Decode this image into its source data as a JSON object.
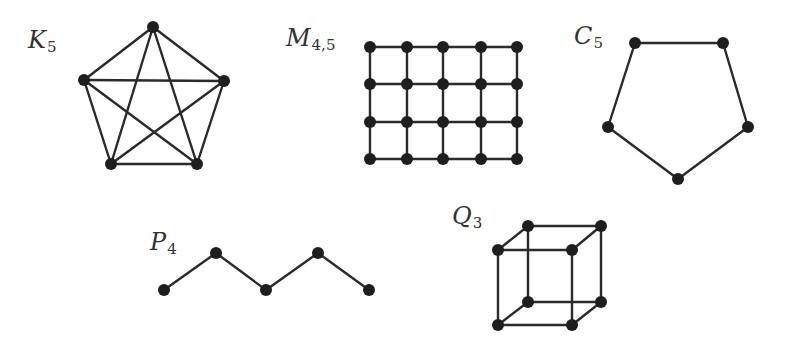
{
  "colors": {
    "edge": "#2a2a2a",
    "node": "#1e1e1e",
    "background": "#ffffff"
  },
  "style": {
    "node_radius": 6,
    "edge_width": 2.4
  },
  "graphs": [
    {
      "id": "K5",
      "label_main": "K",
      "label_sub": "5",
      "label_pos": [
        28,
        28
      ],
      "nodes": [
        [
          153,
          27
        ],
        [
          84,
          80
        ],
        [
          224,
          81
        ],
        [
          111,
          164
        ],
        [
          197,
          164
        ]
      ],
      "edges": [
        [
          0,
          1
        ],
        [
          0,
          2
        ],
        [
          0,
          3
        ],
        [
          0,
          4
        ],
        [
          1,
          2
        ],
        [
          1,
          3
        ],
        [
          1,
          4
        ],
        [
          2,
          3
        ],
        [
          2,
          4
        ],
        [
          3,
          4
        ]
      ]
    },
    {
      "id": "M45",
      "label_main": "M",
      "label_sub": "4,5",
      "label_pos": [
        286,
        26
      ],
      "grid": {
        "xs": [
          370,
          407,
          443,
          481,
          517
        ],
        "ys": [
          47,
          84,
          122,
          159
        ]
      }
    },
    {
      "id": "C5",
      "label_main": "C",
      "label_sub": "5",
      "label_pos": [
        574,
        24
      ],
      "nodes": [
        [
          635,
          43
        ],
        [
          723,
          43
        ],
        [
          748,
          127
        ],
        [
          678,
          179
        ],
        [
          608,
          127
        ]
      ],
      "edges": [
        [
          0,
          1
        ],
        [
          1,
          2
        ],
        [
          2,
          3
        ],
        [
          3,
          4
        ],
        [
          4,
          0
        ]
      ]
    },
    {
      "id": "P4",
      "label_main": "P",
      "label_sub": "4",
      "label_pos": [
        150,
        230
      ],
      "nodes": [
        [
          164,
          290
        ],
        [
          216,
          253
        ],
        [
          266,
          290
        ],
        [
          318,
          253
        ],
        [
          369,
          290
        ]
      ],
      "edges": [
        [
          0,
          1
        ],
        [
          1,
          2
        ],
        [
          2,
          3
        ],
        [
          3,
          4
        ]
      ]
    },
    {
      "id": "Q3",
      "label_main": "Q",
      "label_sub": "3",
      "label_pos": [
        452,
        204
      ],
      "nodes": [
        [
          528,
          226
        ],
        [
          601,
          226
        ],
        [
          528,
          302
        ],
        [
          601,
          302
        ],
        [
          498,
          250
        ],
        [
          572,
          250
        ],
        [
          498,
          325
        ],
        [
          572,
          325
        ]
      ],
      "edges": [
        [
          0,
          1
        ],
        [
          0,
          2
        ],
        [
          1,
          3
        ],
        [
          2,
          3
        ],
        [
          4,
          5
        ],
        [
          4,
          6
        ],
        [
          5,
          7
        ],
        [
          6,
          7
        ],
        [
          0,
          4
        ],
        [
          1,
          5
        ],
        [
          2,
          6
        ],
        [
          3,
          7
        ]
      ]
    }
  ]
}
